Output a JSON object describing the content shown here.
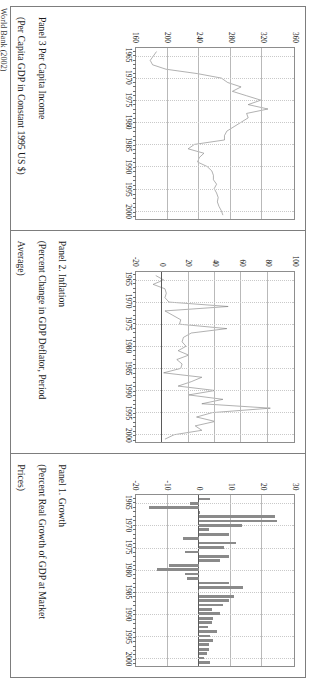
{
  "document": {
    "orientation": "landscape-rotated",
    "source_note": "World Bank (2002)"
  },
  "panels": [
    {
      "id": "panel-3",
      "title": "Panel 3  Per Capita Income",
      "subtitle": "(Per Capita GDP in Constant 1995 US $)",
      "subtitle2": "",
      "y_ticks": [
        "160",
        "200",
        "240",
        "280",
        "320",
        "360"
      ],
      "x_ticks": [
        "1965",
        "1970",
        "1975",
        "1980",
        "1985",
        "1990",
        "1995",
        "2000"
      ]
    },
    {
      "id": "panel-2",
      "title": "Panel 2. Inflation",
      "subtitle": "(Percent Change in GDP Deflator, Period",
      "subtitle2": "Average)",
      "y_ticks": [
        "-20",
        "0",
        "20",
        "40",
        "60",
        "80",
        "100"
      ],
      "x_ticks": [
        "1965",
        "1970",
        "1975",
        "1980",
        "1985",
        "1990",
        "1995",
        "2000"
      ]
    },
    {
      "id": "panel-1",
      "title": "Panel 1. Growth",
      "subtitle": "(Percent Real Growth of GDP at Market",
      "subtitle2": "Prices)",
      "y_ticks": [
        "-20",
        "-10",
        "0",
        "10",
        "20",
        "30"
      ],
      "x_ticks": [
        "1965",
        "1970",
        "1975",
        "1980",
        "1985",
        "1990",
        "1995",
        "2000"
      ]
    }
  ],
  "chart_data": [
    {
      "id": "panel-1-growth",
      "type": "bar",
      "title": "Panel 1. Growth",
      "xlabel": "",
      "ylabel": "",
      "ylim": [
        -20,
        30
      ],
      "ygrid": [
        -20,
        -10,
        0,
        10,
        20,
        30
      ],
      "grid": true,
      "legend": "none",
      "x": [
        1964,
        1965,
        1966,
        1967,
        1968,
        1969,
        1970,
        1971,
        1972,
        1973,
        1974,
        1975,
        1976,
        1977,
        1978,
        1979,
        1980,
        1981,
        1982,
        1983,
        1984,
        1985,
        1986,
        1987,
        1988,
        1989,
        1990,
        1991,
        1992,
        1993,
        1994,
        1995,
        1996,
        1997,
        1998,
        1999,
        2000,
        2001
      ],
      "values": [
        3.4,
        -3.0,
        -16.0,
        0.4,
        24.0,
        24.5,
        13.5,
        3.0,
        9.5,
        -5.0,
        11.5,
        8.0,
        -4.5,
        9.5,
        6.5,
        -9.5,
        -13.5,
        -4.5,
        -4.0,
        9.5,
        14.0,
        -0.5,
        11.0,
        9.5,
        7.5,
        4.0,
        6.5,
        4.5,
        4.0,
        2.8,
        5.5,
        3.5,
        4.5,
        3.0,
        3.0,
        2.5,
        1.5,
        3.5
      ]
    },
    {
      "id": "panel-2-inflation",
      "type": "line",
      "title": "Panel 2. Inflation",
      "xlabel": "",
      "ylabel": "",
      "ylim": [
        -20,
        100
      ],
      "ygrid": [
        -20,
        0,
        20,
        40,
        60,
        80,
        100
      ],
      "grid": true,
      "legend": "none",
      "x": [
        1964,
        1965,
        1966,
        1967,
        1968,
        1969,
        1970,
        1971,
        1972,
        1973,
        1974,
        1975,
        1976,
        1977,
        1978,
        1979,
        1980,
        1981,
        1982,
        1983,
        1984,
        1985,
        1986,
        1987,
        1988,
        1989,
        1990,
        1991,
        1992,
        1993,
        1994,
        1995,
        1996,
        1997,
        1998,
        1999,
        2000,
        2001
      ],
      "values": [
        -5.0,
        1.0,
        -7.0,
        2.0,
        3.0,
        2.0,
        5.0,
        50.0,
        2.0,
        8.0,
        14.0,
        13.0,
        49.0,
        22.0,
        16.0,
        15.0,
        18.0,
        12.0,
        20.0,
        11.0,
        15.0,
        14.0,
        1.0,
        30.0,
        22.0,
        12.0,
        40.0,
        20.0,
        46.0,
        30.0,
        82.0,
        38.0,
        26.0,
        40.0,
        25.0,
        30.0,
        9.0,
        2.0
      ]
    },
    {
      "id": "panel-3-per-capita-income",
      "type": "line",
      "title": "Panel 3  Per Capita Income",
      "xlabel": "",
      "ylabel": "",
      "ylim": [
        160,
        360
      ],
      "ygrid": [
        160,
        200,
        240,
        280,
        320,
        360
      ],
      "grid": true,
      "legend": "none",
      "x": [
        1964,
        1965,
        1966,
        1967,
        1968,
        1969,
        1970,
        1971,
        1972,
        1973,
        1974,
        1975,
        1976,
        1977,
        1978,
        1979,
        1980,
        1981,
        1982,
        1983,
        1984,
        1985,
        1986,
        1987,
        1988,
        1989,
        1990,
        1991,
        1992,
        1993,
        1994,
        1995,
        1996,
        1997,
        1998,
        1999,
        2000,
        2001
      ],
      "values": [
        186,
        182,
        178,
        181,
        198,
        238,
        268,
        276,
        293,
        282,
        300,
        318,
        302,
        327,
        300,
        302,
        293,
        284,
        275,
        272,
        272,
        234,
        226,
        246,
        240,
        238,
        250,
        256,
        258,
        258,
        262,
        259,
        262,
        264,
        263,
        265,
        268,
        270
      ]
    }
  ]
}
